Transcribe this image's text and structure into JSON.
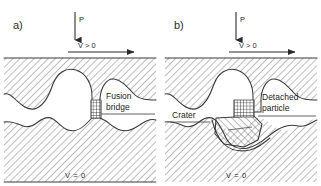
{
  "figure": {
    "background_color": "#ffffff",
    "line_color": "#3a3a3a",
    "hatch_color": "#6a6a6a",
    "text_color": "#2b2b2b"
  },
  "panels": [
    {
      "id": "a",
      "letter": "a)",
      "load_arrow_label": "P",
      "velocity_arrow_label": "V > 0",
      "bottom_label": "V = 0",
      "callouts": [
        {
          "id": "fusion-bridge",
          "line1": "Fusion",
          "line2": "bridge"
        }
      ]
    },
    {
      "id": "b",
      "letter": "b)",
      "load_arrow_label": "P",
      "velocity_arrow_label": "V > 0",
      "bottom_label": "V = 0",
      "callouts": [
        {
          "id": "crater",
          "line1": "Crater",
          "line2": ""
        },
        {
          "id": "detached-particle",
          "line1": "Detached",
          "line2": "particle"
        }
      ]
    }
  ]
}
